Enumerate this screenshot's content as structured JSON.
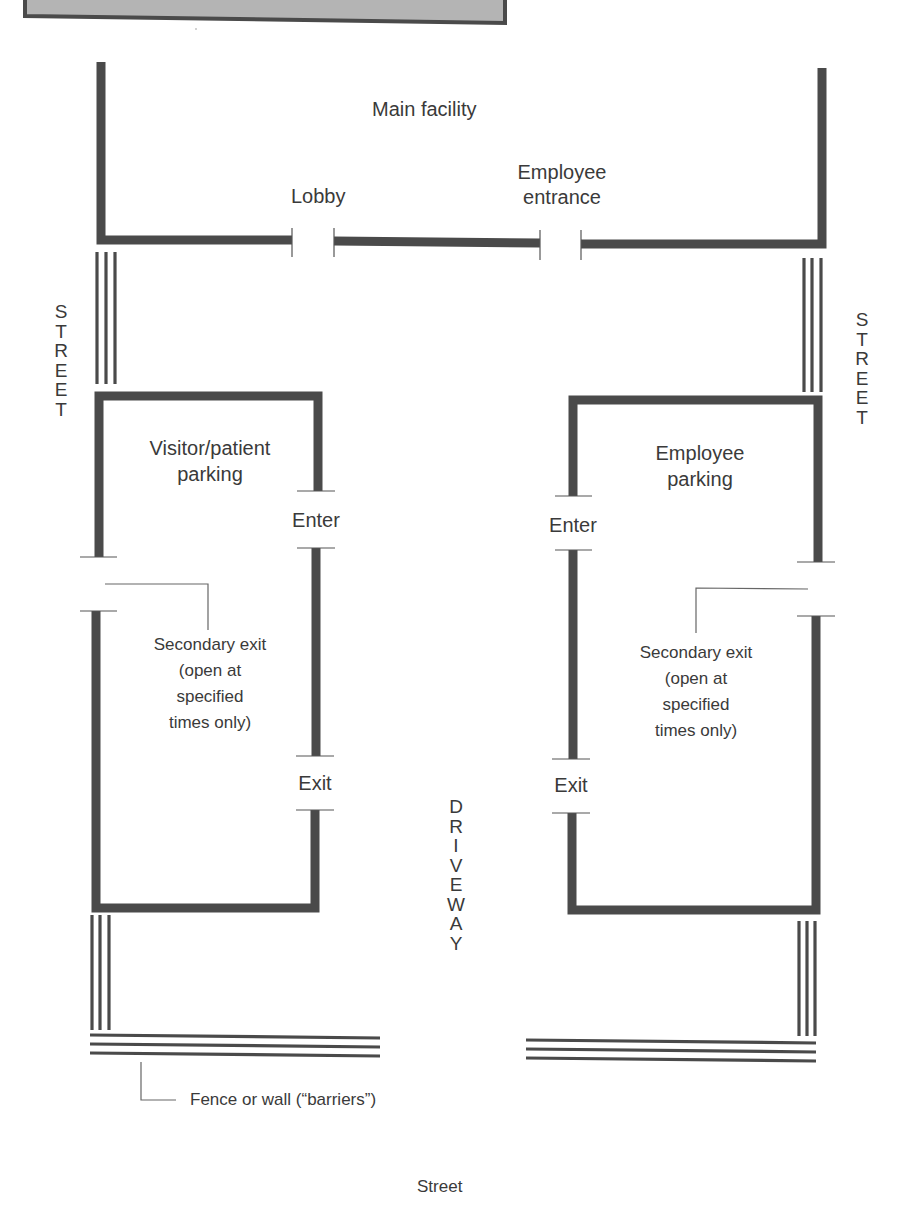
{
  "colors": {
    "wall": "#4a4a4a",
    "barrier": "#4a4a4a",
    "banner_fill": "#b4b4b4",
    "banner_border": "#4a4a4a",
    "text": "#3a3a3a",
    "background": "#ffffff"
  },
  "labels": {
    "main_facility": "Main facility",
    "lobby": "Lobby",
    "employee_entrance_line1": "Employee",
    "employee_entrance_line2": "entrance",
    "street_left": "S\nT\nR\nE\nE\nT",
    "street_right": "S\nT\nR\nE\nE\nT",
    "visitor_parking_line1": "Visitor/patient",
    "visitor_parking_line2": "parking",
    "employee_parking_line1": "Employee",
    "employee_parking_line2": "parking",
    "left_enter": "Enter",
    "left_exit": "Exit",
    "right_enter": "Enter",
    "right_exit": "Exit",
    "left_secondary_exit": [
      "Secondary exit",
      "(open at",
      "specified",
      "times only)"
    ],
    "right_secondary_exit": [
      "Secondary exit",
      "(open at",
      "specified",
      "times only)"
    ],
    "driveway": "D\nR\nI\nV\nE\nW\nA\nY",
    "barrier_note": "Fence or wall (“barriers”)",
    "bottom_street": "Street"
  }
}
